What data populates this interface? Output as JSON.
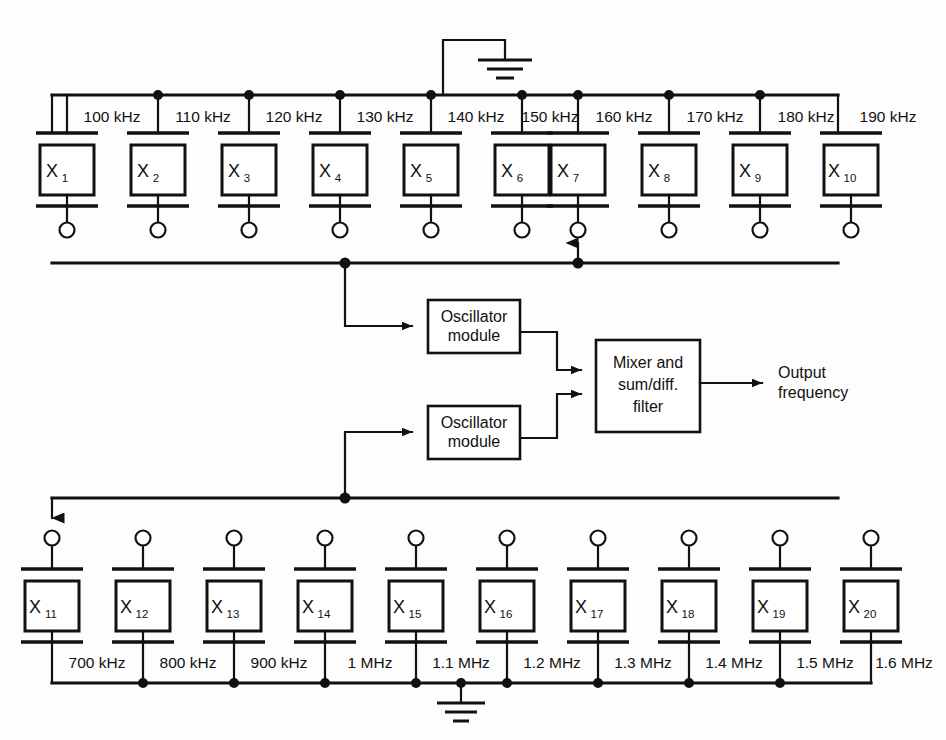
{
  "diagram": {
    "top_bank": {
      "crystals": [
        {
          "id": "X",
          "sub": "1"
        },
        {
          "id": "X",
          "sub": "2"
        },
        {
          "id": "X",
          "sub": "3"
        },
        {
          "id": "X",
          "sub": "4"
        },
        {
          "id": "X",
          "sub": "5"
        },
        {
          "id": "X",
          "sub": "6"
        },
        {
          "id": "X",
          "sub": "7"
        },
        {
          "id": "X",
          "sub": "8"
        },
        {
          "id": "X",
          "sub": "9"
        },
        {
          "id": "X",
          "sub": "10"
        }
      ],
      "frequencies": [
        "100 kHz",
        "110 kHz",
        "120 kHz",
        "130 kHz",
        "140 kHz",
        "150 kHz",
        "160 kHz",
        "170 kHz",
        "180 kHz",
        "190 kHz"
      ],
      "selected_crystal": "X7",
      "ground_between": [
        "140 kHz",
        "150 kHz"
      ]
    },
    "bottom_bank": {
      "crystals": [
        {
          "id": "X",
          "sub": "11"
        },
        {
          "id": "X",
          "sub": "12"
        },
        {
          "id": "X",
          "sub": "13"
        },
        {
          "id": "X",
          "sub": "14"
        },
        {
          "id": "X",
          "sub": "15"
        },
        {
          "id": "X",
          "sub": "16"
        },
        {
          "id": "X",
          "sub": "17"
        },
        {
          "id": "X",
          "sub": "18"
        },
        {
          "id": "X",
          "sub": "19"
        },
        {
          "id": "X",
          "sub": "20"
        }
      ],
      "frequencies": [
        "700 kHz",
        "800 kHz",
        "900 kHz",
        "1 MHz",
        "1.1 MHz",
        "1.2 MHz",
        "1.3 MHz",
        "1.4 MHz",
        "1.5 MHz",
        "1.6 MHz"
      ],
      "selected_crystal": "X11",
      "ground_between": [
        "1.1 MHz",
        "1.2 MHz"
      ]
    },
    "blocks": {
      "oscillator_top": {
        "line1": "Oscillator",
        "line2": "module"
      },
      "oscillator_bottom": {
        "line1": "Oscillator",
        "line2": "module"
      },
      "mixer": {
        "line1": "Mixer and",
        "line2": "sum/diff.",
        "line3": "filter"
      }
    },
    "output": {
      "line1": "Output",
      "line2": "frequency"
    },
    "colors": {
      "stroke": "#111111",
      "background": "#fdfdfd",
      "fill": "#ffffff"
    }
  }
}
